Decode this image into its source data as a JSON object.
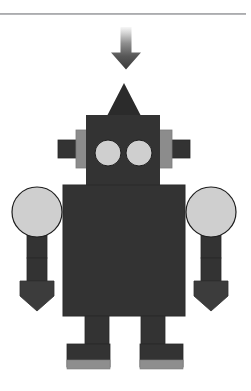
{
  "canvas": {
    "width": 251,
    "height": 391,
    "background": "#ffffff"
  },
  "divider": {
    "label": "horizontal-rule",
    "color": "#9d9ea1",
    "y": 13,
    "width": 246,
    "height": 2
  },
  "arrow": {
    "label": "download-arrow",
    "direction": "down",
    "gradient_top": "#f2f2f2",
    "gradient_mid": "#9b9b9b",
    "gradient_bottom": "#3a3a3a",
    "x": 110,
    "y": 27,
    "width": 32,
    "height": 43
  },
  "colors": {
    "body_dark": "#333333",
    "accent_dark": "#2b2b2b",
    "hand_dark": "#3c3c3c",
    "light_gray": "#cfcfcf",
    "mid_gray": "#8c8c8c",
    "outline": "#1a1a1a",
    "sole_gray": "#8e8e8e",
    "white": "#ffffff"
  },
  "robot": {
    "label": "robot-illustration",
    "parts": [
      {
        "name": "antenna-triangle",
        "shape": "triangle",
        "fill": "#2b2b2b"
      },
      {
        "name": "head",
        "shape": "rect",
        "fill": "#333333"
      },
      {
        "name": "left-ear-inner",
        "shape": "rect",
        "fill": "#8c8c8c"
      },
      {
        "name": "left-ear-outer",
        "shape": "rect",
        "fill": "#333333"
      },
      {
        "name": "right-ear-inner",
        "shape": "rect",
        "fill": "#8c8c8c"
      },
      {
        "name": "right-ear-outer",
        "shape": "rect",
        "fill": "#333333"
      },
      {
        "name": "left-eye",
        "shape": "circle",
        "fill": "#cfcfcf"
      },
      {
        "name": "right-eye",
        "shape": "circle",
        "fill": "#cfcfcf"
      },
      {
        "name": "torso",
        "shape": "rect",
        "fill": "#333333"
      },
      {
        "name": "left-shoulder",
        "shape": "circle",
        "fill": "#cfcfcf"
      },
      {
        "name": "right-shoulder",
        "shape": "circle",
        "fill": "#cfcfcf"
      },
      {
        "name": "left-arm-upper",
        "shape": "rect",
        "fill": "#333333"
      },
      {
        "name": "left-arm-lower",
        "shape": "rect",
        "fill": "#333333"
      },
      {
        "name": "left-hand",
        "shape": "pentagon",
        "fill": "#3c3c3c"
      },
      {
        "name": "right-arm-upper",
        "shape": "rect",
        "fill": "#333333"
      },
      {
        "name": "right-arm-lower",
        "shape": "rect",
        "fill": "#333333"
      },
      {
        "name": "right-hand",
        "shape": "pentagon",
        "fill": "#3c3c3c"
      },
      {
        "name": "left-leg",
        "shape": "rect",
        "fill": "#333333"
      },
      {
        "name": "right-leg",
        "shape": "rect",
        "fill": "#333333"
      },
      {
        "name": "left-foot",
        "shape": "rect",
        "fill": "#333333"
      },
      {
        "name": "left-foot-sole",
        "shape": "rect",
        "fill": "#8e8e8e"
      },
      {
        "name": "right-foot",
        "shape": "rect",
        "fill": "#333333"
      },
      {
        "name": "right-foot-sole",
        "shape": "rect",
        "fill": "#8e8e8e"
      }
    ]
  }
}
